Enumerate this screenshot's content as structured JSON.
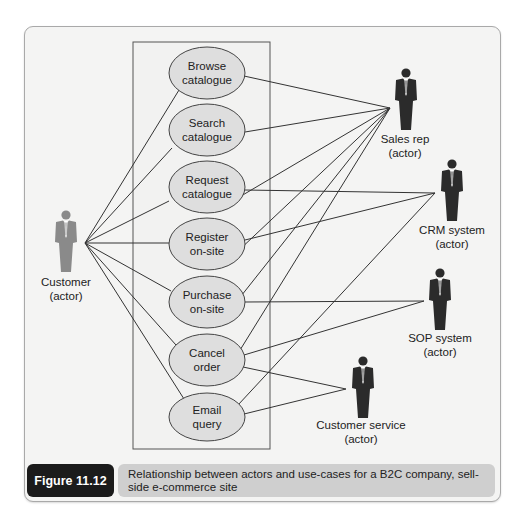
{
  "figure": {
    "number_label": "Figure 11.12",
    "caption": "Relationship between actors and use-cases for a B2C company, sell-side e-commerce site",
    "colors": {
      "frame_bg": "#f4f4f3",
      "usecase_fill": "#dedede",
      "customer_actor": "#8a8a8a",
      "system_actor": "#2b2b2b",
      "caption_tag_bg": "#1b1b1b",
      "caption_text_bg": "#cfcfcf"
    }
  },
  "use_cases": [
    {
      "id": "browse",
      "line1": "Browse",
      "line2": "catalogue"
    },
    {
      "id": "search",
      "line1": "Search",
      "line2": "catalogue"
    },
    {
      "id": "request",
      "line1": "Request",
      "line2": "catalogue"
    },
    {
      "id": "register",
      "line1": "Register",
      "line2": "on-site"
    },
    {
      "id": "purchase",
      "line1": "Purchase",
      "line2": "on-site"
    },
    {
      "id": "cancel",
      "line1": "Cancel",
      "line2": "order"
    },
    {
      "id": "email",
      "line1": "Email",
      "line2": "query"
    }
  ],
  "actors": [
    {
      "id": "customer",
      "line1": "Customer",
      "line2": "(actor)",
      "connects": [
        "browse",
        "search",
        "request",
        "register",
        "purchase",
        "cancel",
        "email"
      ]
    },
    {
      "id": "sales_rep",
      "line1": "Sales rep",
      "line2": "(actor)",
      "connects": [
        "browse",
        "search",
        "request",
        "register",
        "purchase",
        "cancel"
      ]
    },
    {
      "id": "crm",
      "line1": "CRM system",
      "line2": "(actor)",
      "connects": [
        "request",
        "register",
        "email"
      ]
    },
    {
      "id": "sop",
      "line1": "SOP system",
      "line2": "(actor)",
      "connects": [
        "purchase",
        "cancel"
      ]
    },
    {
      "id": "customer_service",
      "line1": "Customer service",
      "line2": "(actor)",
      "connects": [
        "cancel",
        "email"
      ]
    }
  ]
}
